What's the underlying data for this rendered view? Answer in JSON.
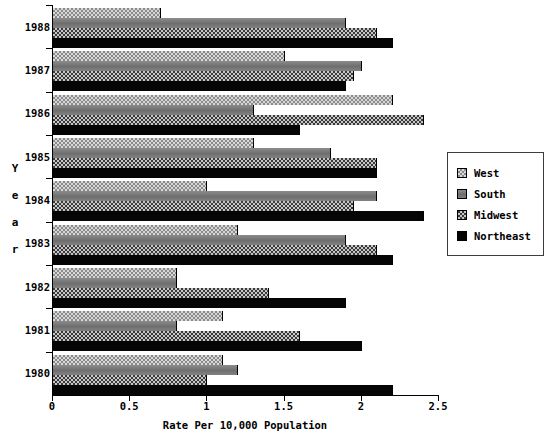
{
  "chart_data": {
    "type": "bar",
    "orientation": "horizontal",
    "title": "",
    "xlabel": "Rate Per 10,000 Population",
    "ylabel": "Year",
    "xlim": [
      0,
      2.5
    ],
    "xticks": [
      "0",
      "0.5",
      "1",
      "1.5",
      "2",
      "2.5"
    ],
    "xtick_values": [
      0,
      0.5,
      1,
      1.5,
      2,
      2.5
    ],
    "grid": false,
    "categories": [
      "1988",
      "1987",
      "1986",
      "1985",
      "1984",
      "1983",
      "1982",
      "1981",
      "1980"
    ],
    "legend_position": "right",
    "series": [
      {
        "name": "West",
        "pattern": "light-checker",
        "values": [
          0.7,
          1.5,
          2.2,
          1.3,
          1.0,
          1.2,
          0.8,
          1.1,
          1.1
        ]
      },
      {
        "name": "South",
        "pattern": "solid-gray",
        "values": [
          1.9,
          2.0,
          1.3,
          1.8,
          2.1,
          1.9,
          0.8,
          0.8,
          1.2
        ]
      },
      {
        "name": "Midwest",
        "pattern": "dark-checker",
        "values": [
          2.1,
          1.95,
          2.4,
          2.1,
          1.95,
          2.1,
          1.4,
          1.6,
          1.0
        ]
      },
      {
        "name": "Northeast",
        "pattern": "solid-black",
        "values": [
          2.2,
          1.9,
          1.6,
          2.1,
          2.4,
          2.2,
          1.9,
          2.0,
          2.2
        ]
      }
    ]
  },
  "yaxis": {
    "title_letters": [
      "Y",
      "e",
      "a",
      "r"
    ]
  },
  "legend": {
    "items": [
      {
        "label": "West"
      },
      {
        "label": "South"
      },
      {
        "label": "Midwest"
      },
      {
        "label": "Northeast"
      }
    ]
  },
  "colors": {
    "background": "#ffffff",
    "foreground": "#000000",
    "west": "#d8d8d8",
    "south": "#777777",
    "midwest": "#3a3a3a",
    "northeast": "#050505"
  }
}
